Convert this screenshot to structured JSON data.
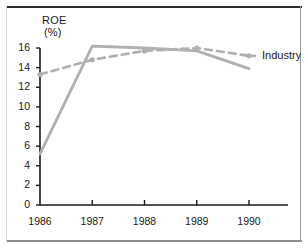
{
  "figure": {
    "y_axis_title_line1": "ROE",
    "y_axis_title_line2": "(%)",
    "legend_label": "Industry",
    "line_color": "#b0b0b0",
    "axis_color": "#1a1a1a",
    "frame_color": "#2b2b2b",
    "background": "#ffffff"
  },
  "chart_data": {
    "type": "line",
    "title": "",
    "xlabel": "",
    "ylabel": "ROE (%)",
    "categories": [
      "1986",
      "1987",
      "1988",
      "1989",
      "1990"
    ],
    "x": [
      1986,
      1987,
      1988,
      1989,
      1990
    ],
    "ylim": [
      0,
      16
    ],
    "xlim": [
      1986,
      1990
    ],
    "yticks": [
      0,
      2,
      4,
      6,
      8,
      10,
      12,
      14,
      16
    ],
    "ytick_labels": [
      "0",
      "2",
      "4",
      "6",
      "8",
      "10",
      "12",
      "14",
      "16"
    ],
    "xtick_labels": [
      "1986",
      "1987",
      "1988",
      "1989",
      "1990"
    ],
    "grid": false,
    "legend_position": "right-inline-end-of-line",
    "series": [
      {
        "name": "Company",
        "style": "solid",
        "color": "#b0b0b0",
        "markers": false,
        "values": [
          5.2,
          16.2,
          16.0,
          15.7,
          13.9
        ]
      },
      {
        "name": "Industry",
        "style": "dashed",
        "color": "#b0b0b0",
        "markers": true,
        "values": [
          13.3,
          14.8,
          15.7,
          16.0,
          15.2
        ]
      }
    ]
  }
}
